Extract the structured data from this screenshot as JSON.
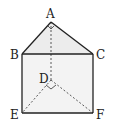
{
  "figure": {
    "type": "triangular prism",
    "points": {
      "A": {
        "x": 51,
        "y": 22
      },
      "B": {
        "x": 22,
        "y": 54
      },
      "C": {
        "x": 93,
        "y": 54
      },
      "D": {
        "x": 51,
        "y": 80
      },
      "E": {
        "x": 22,
        "y": 113
      },
      "F": {
        "x": 93,
        "y": 113
      }
    },
    "labels": {
      "A": "A",
      "B": "B",
      "C": "C",
      "D": "D",
      "E": "E",
      "F": "F"
    },
    "solid_edges": [
      "AB",
      "AC",
      "BC",
      "BE",
      "CF",
      "EF"
    ],
    "dashed_edges": [
      "AD",
      "DE",
      "DF"
    ],
    "right_angles": [
      "BAC",
      "EDF"
    ],
    "colors": {
      "stroke": "#222222",
      "face_fill": "#ececec",
      "background": "#ffffff"
    }
  }
}
